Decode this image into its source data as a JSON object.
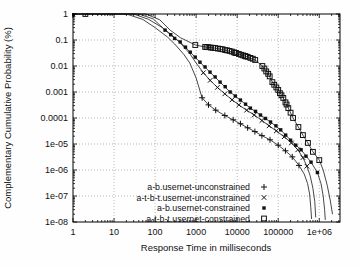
{
  "figure": {
    "width": 360,
    "height": 266,
    "background": "#fefefe"
  },
  "chart_data": {
    "type": "line",
    "scale": "log-log",
    "title": "",
    "xlabel": "Response Time in milliseconds",
    "ylabel": "Complementary Cumulative Probability (%)",
    "x_range": [
      1,
      3200000
    ],
    "y_range": [
      1e-08,
      1
    ],
    "x_tick_values": [
      1,
      10,
      100,
      1000,
      10000,
      100000,
      1000000
    ],
    "x_tick_labels": [
      "1",
      "10",
      "100",
      "1000",
      "10000",
      "100000",
      "1e+06"
    ],
    "y_tick_values": [
      1,
      0.1,
      0.01,
      0.001,
      0.0001,
      1e-05,
      1e-06,
      1e-07,
      1e-08
    ],
    "y_tick_labels": [
      "1",
      "0.1",
      "0.01",
      "0.001",
      "0.0001",
      "1e-05",
      "1e-06",
      "1e-07",
      "1e-08"
    ],
    "grid": "dotted-major-decades",
    "legend_position": "inside-bottom-right",
    "colors": {
      "line": "#333333",
      "marker": "#111111",
      "grid": "#999999",
      "border": "#000000",
      "text": "#111111"
    },
    "series": [
      {
        "name": "a-b.usernet-unconstrained",
        "marker": "plus",
        "line": [
          [
            1,
            1
          ],
          [
            20,
            1
          ],
          [
            50,
            0.62
          ],
          [
            100,
            0.3
          ],
          [
            200,
            0.13
          ],
          [
            300,
            0.07
          ],
          [
            500,
            0.028
          ],
          [
            700,
            0.013
          ],
          [
            1000,
            0.0035
          ],
          [
            1400,
            0.0006
          ],
          [
            2000,
            0.00032
          ],
          [
            3000,
            0.0002
          ],
          [
            5000,
            0.000125
          ],
          [
            8000,
            8.5e-05
          ],
          [
            12000,
            6e-05
          ],
          [
            18000,
            4.2e-05
          ],
          [
            27000,
            3e-05
          ],
          [
            40000,
            2.1e-05
          ],
          [
            63000,
            1.45e-05
          ],
          [
            100000,
            9e-06
          ],
          [
            150000,
            5.5e-06
          ],
          [
            220000,
            3.2e-06
          ],
          [
            320000,
            1.5e-06
          ],
          [
            430000,
            7e-07
          ],
          [
            520000,
            3e-07
          ],
          [
            580000,
            1.2e-07
          ],
          [
            620000,
            4e-08
          ],
          [
            650000,
            1.3e-08
          ]
        ],
        "markers": [
          [
            1,
            1
          ],
          [
            1400,
            0.0006
          ],
          [
            2000,
            0.00032
          ],
          [
            3000,
            0.0002
          ],
          [
            5000,
            0.000125
          ],
          [
            8000,
            8.5e-05
          ],
          [
            12000,
            6e-05
          ],
          [
            18000,
            4.2e-05
          ],
          [
            27000,
            3e-05
          ],
          [
            40000,
            2.1e-05
          ],
          [
            63000,
            1.45e-05
          ],
          [
            100000,
            9e-06
          ],
          [
            150000,
            5.5e-06
          ],
          [
            220000,
            3.2e-06
          ],
          [
            320000,
            1.5e-06
          ]
        ]
      },
      {
        "name": "a-t-b-t.usernet-unconstrained",
        "marker": "cross",
        "line": [
          [
            1,
            1
          ],
          [
            30,
            1
          ],
          [
            70,
            0.62
          ],
          [
            150,
            0.3
          ],
          [
            250,
            0.16
          ],
          [
            400,
            0.08
          ],
          [
            700,
            0.03
          ],
          [
            1000,
            0.013
          ],
          [
            1500,
            0.0055
          ],
          [
            2200,
            0.0028
          ],
          [
            3300,
            0.0015
          ],
          [
            5000,
            0.00085
          ],
          [
            7500,
            0.0005
          ],
          [
            11000,
            0.00032
          ],
          [
            17000,
            0.0002
          ],
          [
            26000,
            0.00013
          ],
          [
            40000,
            8e-05
          ],
          [
            60000,
            5e-05
          ],
          [
            90000,
            3.2e-05
          ],
          [
            140000,
            1.9e-05
          ],
          [
            210000,
            1.1e-05
          ],
          [
            300000,
            6e-06
          ],
          [
            400000,
            3e-06
          ],
          [
            500000,
            1.4e-06
          ],
          [
            600000,
            6e-07
          ],
          [
            700000,
            2e-07
          ],
          [
            780000,
            6e-08
          ],
          [
            820000,
            1.5e-08
          ]
        ],
        "markers": [
          [
            1,
            1
          ],
          [
            1500,
            0.0055
          ],
          [
            2200,
            0.0028
          ],
          [
            3300,
            0.0015
          ],
          [
            5000,
            0.00085
          ],
          [
            7500,
            0.0005
          ],
          [
            11000,
            0.00032
          ],
          [
            17000,
            0.0002
          ],
          [
            26000,
            0.00013
          ],
          [
            40000,
            8e-05
          ],
          [
            60000,
            5e-05
          ],
          [
            90000,
            3.2e-05
          ],
          [
            140000,
            1.9e-05
          ],
          [
            210000,
            1.1e-05
          ],
          [
            300000,
            6e-06
          ],
          [
            400000,
            3e-06
          ],
          [
            500000,
            1.4e-06
          ]
        ]
      },
      {
        "name": "a-b.usernet-constrained",
        "marker": "filled-square",
        "line": [
          [
            1,
            1
          ],
          [
            40,
            1
          ],
          [
            90,
            0.65
          ],
          [
            175,
            0.24
          ],
          [
            300,
            0.115
          ],
          [
            408,
            0.084
          ],
          [
            719,
            0.034
          ],
          [
            1240,
            0.014
          ],
          [
            2180,
            0.0058
          ],
          [
            3830,
            0.0024
          ],
          [
            6740,
            0.001
          ],
          [
            12000,
            0.00049
          ],
          [
            21000,
            0.00024
          ],
          [
            37000,
            0.00013
          ],
          [
            65000,
            7e-05
          ],
          [
            115000,
            3.5e-05
          ],
          [
            200000,
            1.4e-05
          ],
          [
            360000,
            6e-06
          ],
          [
            630000,
            2e-06
          ],
          [
            900000,
            8e-07
          ],
          [
            1100000,
            3e-07
          ],
          [
            1250000,
            1e-07
          ],
          [
            1350000,
            3e-08
          ],
          [
            1400000,
            1.2e-08
          ]
        ],
        "markers": [
          [
            1,
            1
          ],
          [
            175,
            0.24
          ],
          [
            240,
            0.16
          ],
          [
            300,
            0.115
          ],
          [
            408,
            0.084
          ],
          [
            550,
            0.053
          ],
          [
            719,
            0.034
          ],
          [
            950,
            0.022
          ],
          [
            1240,
            0.014
          ],
          [
            1650,
            0.0092
          ],
          [
            2180,
            0.0058
          ],
          [
            2900,
            0.0038
          ],
          [
            3830,
            0.0024
          ],
          [
            5100,
            0.0016
          ],
          [
            6740,
            0.001
          ],
          [
            9000,
            0.0007
          ],
          [
            12000,
            0.00049
          ],
          [
            16000,
            0.00034
          ],
          [
            21000,
            0.00024
          ],
          [
            28000,
            0.00018
          ],
          [
            37000,
            0.00013
          ],
          [
            49000,
            9.6e-05
          ],
          [
            65000,
            7e-05
          ],
          [
            88000,
            5e-05
          ],
          [
            115000,
            3.5e-05
          ],
          [
            152000,
            2.2e-05
          ],
          [
            200000,
            1.4e-05
          ],
          [
            268000,
            9e-06
          ],
          [
            360000,
            6e-06
          ],
          [
            475000,
            3.4e-06
          ],
          [
            630000,
            2e-06
          ],
          [
            900000,
            8e-07
          ]
        ]
      },
      {
        "name": "a-t-b-t.usernet-constrained",
        "marker": "open-square",
        "line": [
          [
            2,
            1
          ],
          [
            60,
            1
          ],
          [
            130,
            0.6
          ],
          [
            232,
            0.24
          ],
          [
            420,
            0.12
          ],
          [
            542,
            0.1
          ],
          [
            954,
            0.064
          ],
          [
            1660,
            0.054
          ],
          [
            2900,
            0.049
          ],
          [
            5100,
            0.041
          ],
          [
            9000,
            0.032
          ],
          [
            15700,
            0.024
          ],
          [
            27500,
            0.017
          ],
          [
            41000,
            0.01
          ],
          [
            57000,
            0.005
          ],
          [
            72000,
            0.0024
          ],
          [
            100000,
            0.0012
          ],
          [
            133000,
            0.00059
          ],
          [
            176000,
            0.00024
          ],
          [
            230000,
            0.0001
          ],
          [
            310000,
            4.5e-05
          ],
          [
            400000,
            2.2e-05
          ],
          [
            530000,
            1.1e-05
          ],
          [
            700000,
            5e-06
          ],
          [
            1000000,
            2.4e-06
          ],
          [
            1250000,
            1e-06
          ],
          [
            1560000,
            2.6e-07
          ],
          [
            1850000,
            7e-08
          ],
          [
            2100000,
            2e-08
          ]
        ],
        "markers": [
          [
            2,
            1
          ],
          [
            954,
            0.064
          ],
          [
            1660,
            0.054
          ],
          [
            1800,
            0.0535
          ],
          [
            2000,
            0.053
          ],
          [
            2300,
            0.051
          ],
          [
            2600,
            0.05
          ],
          [
            2900,
            0.049
          ],
          [
            3400,
            0.047
          ],
          [
            3900,
            0.0455
          ],
          [
            4400,
            0.044
          ],
          [
            5100,
            0.041
          ],
          [
            5700,
            0.04
          ],
          [
            6500,
            0.038
          ],
          [
            7400,
            0.036
          ],
          [
            8400,
            0.0335
          ],
          [
            9000,
            0.032
          ],
          [
            9500,
            0.0315
          ],
          [
            11000,
            0.029
          ],
          [
            12500,
            0.027
          ],
          [
            14000,
            0.0255
          ],
          [
            15700,
            0.024
          ],
          [
            16000,
            0.0235
          ],
          [
            18000,
            0.0225
          ],
          [
            21000,
            0.0205
          ],
          [
            24000,
            0.019
          ],
          [
            27500,
            0.017
          ],
          [
            41000,
            0.01
          ],
          [
            46000,
            0.008
          ],
          [
            51000,
            0.0062
          ],
          [
            57000,
            0.005
          ],
          [
            62000,
            0.004
          ],
          [
            72000,
            0.0024
          ],
          [
            80000,
            0.0019
          ],
          [
            90000,
            0.0015
          ],
          [
            100000,
            0.0012
          ],
          [
            110000,
            0.0009
          ],
          [
            120000,
            0.00075
          ],
          [
            133000,
            0.00059
          ],
          [
            150000,
            0.0004
          ],
          [
            160000,
            0.00033
          ],
          [
            176000,
            0.00024
          ],
          [
            200000,
            0.00016
          ],
          [
            230000,
            0.0001
          ],
          [
            310000,
            4.5e-05
          ],
          [
            400000,
            2.2e-05
          ],
          [
            530000,
            1.1e-05
          ],
          [
            700000,
            5e-06
          ],
          [
            1000000,
            2.4e-06
          ]
        ]
      }
    ]
  }
}
